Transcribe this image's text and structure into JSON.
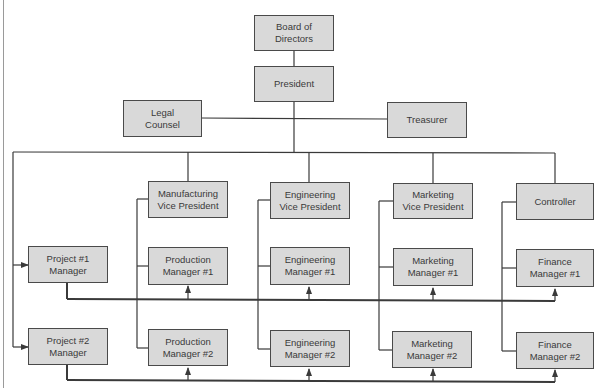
{
  "diagram": {
    "type": "organization-chart",
    "colors": {
      "box_fill": "#d9d9d9",
      "box_border": "#4a4a4a",
      "line": "#3a3a3a",
      "text": "#3a3a3a"
    },
    "top": {
      "board": {
        "line1": "Board of",
        "line2": "Directors"
      },
      "president": {
        "line1": "President"
      },
      "legal": {
        "line1": "Legal",
        "line2": "Counsel"
      },
      "treasurer": {
        "line1": "Treasurer"
      }
    },
    "vps": [
      {
        "line1": "Manufacturing",
        "line2": "Vice President"
      },
      {
        "line1": "Engineering",
        "line2": "Vice President"
      },
      {
        "line1": "Marketing",
        "line2": "Vice President"
      },
      {
        "line1": "Controller"
      }
    ],
    "row1": [
      {
        "line1": "Project #1",
        "line2": "Manager"
      },
      {
        "line1": "Production",
        "line2": "Manager #1"
      },
      {
        "line1": "Engineering",
        "line2": "Manager #1"
      },
      {
        "line1": "Marketing",
        "line2": "Manager #1"
      },
      {
        "line1": "Finance",
        "line2": "Manager #1"
      }
    ],
    "row2": [
      {
        "line1": "Project #2",
        "line2": "Manager"
      },
      {
        "line1": "Production",
        "line2": "Manager #2"
      },
      {
        "line1": "Engineering",
        "line2": "Manager #2"
      },
      {
        "line1": "Marketing",
        "line2": "Manager #2"
      },
      {
        "line1": "Finance",
        "line2": "Manager #2"
      }
    ]
  }
}
